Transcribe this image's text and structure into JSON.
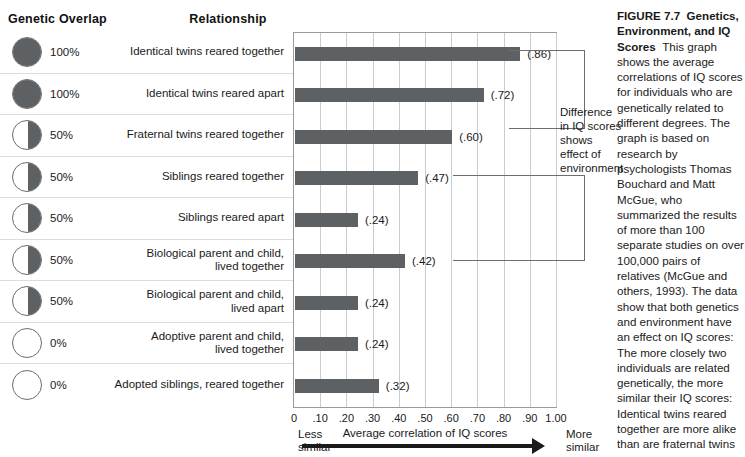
{
  "headers": {
    "genetic_overlap": "Genetic Overlap",
    "relationship": "Relationship"
  },
  "chart_data": {
    "type": "bar",
    "orientation": "horizontal",
    "xlabel": "Average correlation of IQ scores",
    "ylabel": "",
    "xlim": [
      0,
      1.0
    ],
    "grid": true,
    "legend": "none",
    "categories": [
      "Identical twins reared together",
      "Identical twins reared apart",
      "Fraternal twins reared together",
      "Siblings reared together",
      "Siblings reared apart",
      "Biological parent and child, lived together",
      "Biological parent and child, lived apart",
      "Adoptive parent and child, lived together",
      "Adopted siblings, reared together"
    ],
    "values": [
      0.86,
      0.72,
      0.6,
      0.47,
      0.24,
      0.42,
      0.24,
      0.24,
      0.32
    ],
    "value_labels": [
      "(.86)",
      "(.72)",
      "(.60)",
      "(.47)",
      "(.24)",
      "(.42)",
      "(.24)",
      "(.24)",
      "(.32)"
    ],
    "genetic_overlap": [
      "100%",
      "100%",
      "50%",
      "50%",
      "50%",
      "50%",
      "50%",
      "0%",
      "0%"
    ],
    "genetic_overlap_values": [
      100,
      100,
      50,
      50,
      50,
      50,
      50,
      0,
      0
    ],
    "tick_labels": [
      "0",
      ".10",
      ".20",
      ".30",
      ".40",
      ".50",
      ".60",
      ".70",
      ".80",
      ".90",
      "1.00"
    ],
    "tick_values": [
      0,
      0.1,
      0.2,
      0.3,
      0.4,
      0.5,
      0.6,
      0.7,
      0.8,
      0.9,
      1.0
    ],
    "bar_color": "#5e6163",
    "grid_color": "#c8ccd0"
  },
  "rows": [
    {
      "overlap": "100%",
      "fill": 100,
      "relationship": [
        "Identical twins reared together"
      ],
      "value": "(.86)",
      "pct": 0.86
    },
    {
      "overlap": "100%",
      "fill": 100,
      "relationship": [
        "Identical twins reared apart"
      ],
      "value": "(.72)",
      "pct": 0.72
    },
    {
      "overlap": "50%",
      "fill": 50,
      "relationship": [
        "Fraternal twins reared together"
      ],
      "value": "(.60)",
      "pct": 0.6
    },
    {
      "overlap": "50%",
      "fill": 50,
      "relationship": [
        "Siblings reared together"
      ],
      "value": "(.47)",
      "pct": 0.47
    },
    {
      "overlap": "50%",
      "fill": 50,
      "relationship": [
        "Siblings reared apart"
      ],
      "value": "(.24)",
      "pct": 0.24
    },
    {
      "overlap": "50%",
      "fill": 50,
      "relationship": [
        "Biological parent and child,",
        "lived together"
      ],
      "value": "(.42)",
      "pct": 0.42
    },
    {
      "overlap": "50%",
      "fill": 50,
      "relationship": [
        "Biological parent and child,",
        "lived apart"
      ],
      "value": "(.24)",
      "pct": 0.24
    },
    {
      "overlap": "0%",
      "fill": 0,
      "relationship": [
        "Adoptive parent and child,",
        "lived together"
      ],
      "value": "(.24)",
      "pct": 0.24
    },
    {
      "overlap": "0%",
      "fill": 0,
      "relationship": [
        "Adopted siblings, reared together"
      ],
      "value": "(.32)",
      "pct": 0.32
    }
  ],
  "axis": {
    "title": "Average correlation of IQ scores",
    "less_similar": "Less\nsimilar",
    "less_similar_line1": "Less",
    "less_similar_line2": "similar",
    "more_similar_line1": "More",
    "more_similar_line2": "similar"
  },
  "annotation": {
    "text": "Difference in IQ scores shows effect of environment"
  },
  "caption": {
    "figure_label": "FIGURE 7.7",
    "title": "Genetics, Environment, and IQ Scores",
    "body": "This graph shows the average correlations of IQ scores for individuals who are genetically related to different degrees. The graph is based on research by psychologists Thomas Bouchard and Matt McGue, who summarized the results of more than 100 separate studies on over 100,000 pairs of relatives (McGue and others, 1993). The data show that both genetics and environment have an effect on IQ scores: The more closely two individuals are related genetically, the more similar their IQ scores: Identical twins reared together are more alike than are fraternal twins reared together. However, the same data also show the importance of environmental influences: Identical twins reared together are more alike than identical twins reared apart, and siblings who are reared together are more alike than are siblings reared in different homes."
  }
}
